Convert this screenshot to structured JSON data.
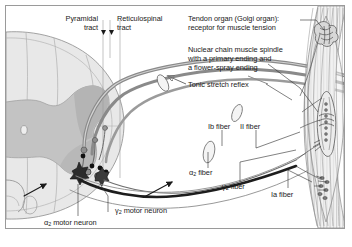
{
  "figure": {
    "border_color": "#9a9a9a",
    "background": "#ffffff",
    "ink_color": "#1a1a1a",
    "gray_matter_fill": "#bfbfbf",
    "white_matter_fill": "#e2e2e2",
    "nerve_gray": "#8c8c8c"
  },
  "labels": {
    "pyramidal_tract": "Pyramidal\ntract",
    "pyramidal_tract_l1": "Pyramidal",
    "pyramidal_tract_l2": "tract",
    "reticulospinal_tract_l1": "Reticulospinal",
    "reticulospinal_tract_l2": "tract",
    "tendon_organ_l1": "Tendon organ (Golgi organ):",
    "tendon_organ_l2": "receptor for muscle tension",
    "muscle_spindle_l1": "Nuclear chain muscle spindle",
    "muscle_spindle_l2": "with a primary ending and",
    "muscle_spindle_l3": "a flower-spray ending",
    "tonic_stretch_reflex": "Tonic stretch reflex",
    "fiber_II": "II fiber",
    "fiber_Ib": "Ib fiber",
    "fiber_alpha2": "fiber",
    "fiber_alpha2_sym": "α",
    "fiber_alpha2_sub": "2",
    "fiber_gamma2": "fiber",
    "fiber_gamma2_sym": "γ",
    "fiber_gamma2_sub": "2",
    "fiber_Ia": "Ia fiber",
    "gamma2_motor_neuron": "motor neuron",
    "gamma2_motor_neuron_sym": "γ",
    "gamma2_motor_neuron_sub": "2",
    "alpha2_motor_neuron": "motor neuron",
    "alpha2_motor_neuron_sym": "α",
    "alpha2_motor_neuron_sub": "2"
  }
}
